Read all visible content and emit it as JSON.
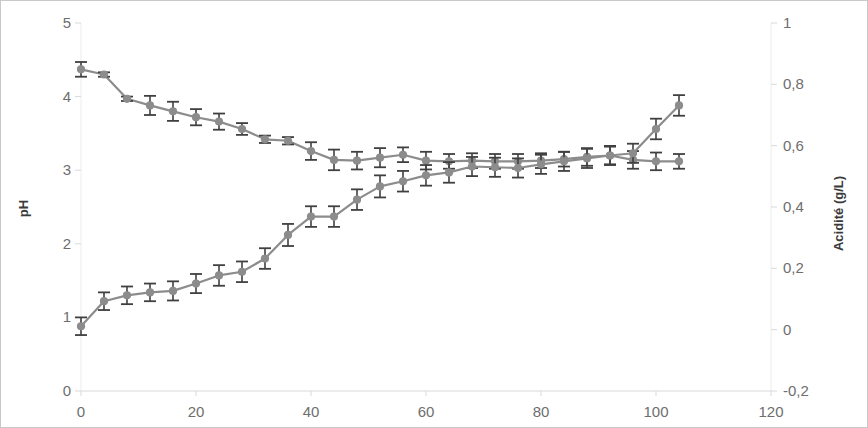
{
  "chart_data": {
    "type": "line",
    "title": "",
    "subtitle": "",
    "xlabel": "",
    "ylabel": "pH",
    "y2label": "Acidité (g/L)",
    "xlim": [
      0,
      120
    ],
    "ylim": [
      0,
      5
    ],
    "y2lim": [
      -0.2,
      1
    ],
    "xticks": [
      0,
      20,
      40,
      60,
      80,
      100,
      120
    ],
    "xtick_labels": [
      "0",
      "20",
      "40",
      "60",
      "80",
      "100",
      "120"
    ],
    "yticks": [
      0,
      1,
      2,
      3,
      4,
      5
    ],
    "ytick_labels": [
      "0",
      "1",
      "2",
      "3",
      "4",
      "5"
    ],
    "y2ticks": [
      -0.2,
      0,
      0.2,
      0.4,
      0.6,
      0.8,
      1
    ],
    "y2tick_labels": [
      "-0,2",
      "0",
      "0,2",
      "0,4",
      "0,6",
      "0,8",
      "1"
    ],
    "grid": false,
    "legend": null,
    "marker": "circle",
    "error_bars": true,
    "series_color": "#8c8c8c",
    "errorbar_color": "#404040",
    "axis_color": "#d9d9d9",
    "tick_text_color": "#6e6e6e",
    "series": [
      {
        "name": "pH",
        "axis": "left",
        "x": [
          0,
          4,
          8,
          12,
          16,
          20,
          24,
          28,
          32,
          36,
          40,
          44,
          48,
          52,
          56,
          60,
          64,
          68,
          72,
          76,
          80,
          84,
          88,
          92,
          96,
          100,
          104
        ],
        "values": [
          4.37,
          4.3,
          3.97,
          3.88,
          3.8,
          3.72,
          3.66,
          3.56,
          3.42,
          3.4,
          3.26,
          3.14,
          3.13,
          3.17,
          3.21,
          3.13,
          3.12,
          3.13,
          3.12,
          3.12,
          3.13,
          3.15,
          3.18,
          3.2,
          3.14,
          3.12,
          3.12
        ],
        "errors": [
          0.1,
          0.03,
          0.03,
          0.13,
          0.13,
          0.11,
          0.11,
          0.08,
          0.05,
          0.05,
          0.12,
          0.14,
          0.12,
          0.13,
          0.1,
          0.12,
          0.1,
          0.1,
          0.1,
          0.1,
          0.1,
          0.1,
          0.12,
          0.12,
          0.12,
          0.12,
          0.1
        ]
      },
      {
        "name": "Acidité",
        "axis": "right",
        "x": [
          0,
          4,
          8,
          12,
          16,
          20,
          24,
          28,
          32,
          36,
          40,
          44,
          48,
          52,
          56,
          60,
          64,
          68,
          72,
          76,
          80,
          84,
          88,
          92,
          96,
          100,
          104
        ],
        "values_left_scale": [
          0.88,
          1.22,
          1.3,
          1.34,
          1.36,
          1.46,
          1.57,
          1.62,
          1.8,
          2.12,
          2.37,
          2.37,
          2.6,
          2.78,
          2.85,
          2.93,
          2.97,
          3.05,
          3.04,
          3.03,
          3.08,
          3.12,
          3.16,
          3.2,
          3.23,
          3.56,
          3.88
        ],
        "values": [
          0.0,
          0.08,
          0.1,
          0.11,
          0.12,
          0.14,
          0.17,
          0.18,
          0.22,
          0.3,
          0.36,
          0.36,
          0.42,
          0.47,
          0.48,
          0.51,
          0.52,
          0.54,
          0.54,
          0.53,
          0.55,
          0.56,
          0.57,
          0.58,
          0.59,
          0.67,
          0.75
        ],
        "errors_left_scale": [
          0.12,
          0.12,
          0.12,
          0.12,
          0.13,
          0.13,
          0.14,
          0.14,
          0.14,
          0.15,
          0.14,
          0.14,
          0.14,
          0.15,
          0.14,
          0.14,
          0.14,
          0.13,
          0.13,
          0.13,
          0.13,
          0.13,
          0.13,
          0.13,
          0.13,
          0.14,
          0.14
        ]
      }
    ]
  }
}
